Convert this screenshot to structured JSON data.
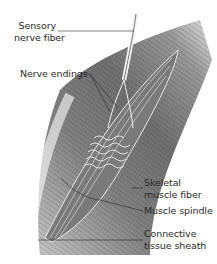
{
  "diagram": {
    "subject": "Muscle spindle",
    "background_color": "#ffffff",
    "line_color": "#2a2a2a",
    "labels": [
      {
        "id": "sensory-nerve-fiber",
        "lines": [
          "Sensory",
          "nerve fiber"
        ]
      },
      {
        "id": "nerve-endings",
        "lines": [
          "Nerve endings"
        ]
      },
      {
        "id": "skeletal-muscle-fiber",
        "lines": [
          "Skeletal",
          "muscle fiber"
        ]
      },
      {
        "id": "muscle-spindle",
        "lines": [
          "Muscle spindle"
        ]
      },
      {
        "id": "connective-tissue-sheath",
        "lines": [
          "Connective",
          "tissue sheath"
        ]
      }
    ]
  }
}
